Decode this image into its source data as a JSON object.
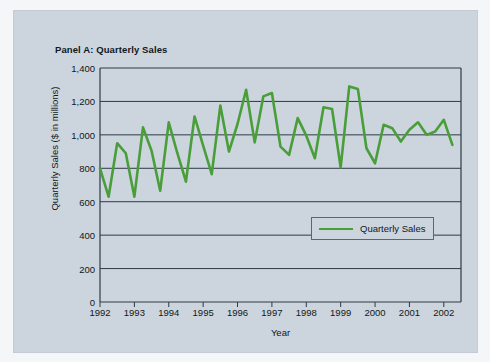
{
  "figure": {
    "panel_title": "Panel A: Quarterly Sales",
    "background_color": "#ccd5dd",
    "axis_color": "#2d3a46",
    "series_color": "#4a9e3a"
  },
  "legend": {
    "position": "inside-lower-right",
    "entries": [
      {
        "label": "Quarterly Sales",
        "color": "#4a9e3a",
        "marker": "line"
      }
    ]
  },
  "chart_data": {
    "type": "line",
    "title": "Panel A: Quarterly Sales",
    "xlabel": "Year",
    "ylabel": "Quarterly Sales ($ in millions)",
    "xlim": [
      1992.0,
      2002.5
    ],
    "ylim": [
      0,
      1400
    ],
    "ytick_labels": [
      "0",
      "200",
      "400",
      "600",
      "800",
      "1,000",
      "1,200",
      "1,400"
    ],
    "ytick_values": [
      0,
      200,
      400,
      600,
      800,
      1000,
      1200,
      1400
    ],
    "xtick_labels": [
      "1992",
      "1993",
      "1994",
      "1995",
      "1996",
      "1997",
      "1998",
      "1999",
      "2000",
      "2001",
      "2002"
    ],
    "xtick_values": [
      1992,
      1993,
      1994,
      1995,
      1996,
      1997,
      1998,
      1999,
      2000,
      2001,
      2002
    ],
    "grid": "horizontal",
    "legend_position": "inside-lower-right",
    "series": [
      {
        "name": "Quarterly Sales",
        "color": "#4a9e3a",
        "x": [
          1992.0,
          1992.25,
          1992.5,
          1992.75,
          1993.0,
          1993.25,
          1993.5,
          1993.75,
          1994.0,
          1994.25,
          1994.5,
          1994.75,
          1995.0,
          1995.25,
          1995.5,
          1995.75,
          1996.0,
          1996.25,
          1996.5,
          1996.75,
          1997.0,
          1997.25,
          1997.5,
          1997.75,
          1998.0,
          1998.25,
          1998.5,
          1998.75,
          1999.0,
          1999.25,
          1999.5,
          1999.75,
          2000.0,
          2000.25,
          2000.5,
          2000.75,
          2001.0,
          2001.25,
          2001.5,
          2001.75,
          2002.0,
          2002.25
        ],
        "values": [
          800,
          630,
          950,
          890,
          630,
          1045,
          905,
          665,
          1075,
          890,
          720,
          1110,
          935,
          765,
          1175,
          900,
          1065,
          1270,
          955,
          1230,
          1250,
          930,
          880,
          1100,
          995,
          860,
          1165,
          1155,
          805,
          1290,
          1275,
          920,
          830,
          1060,
          1040,
          960,
          1030,
          1075,
          1000,
          1020,
          1090,
          940
        ]
      }
    ],
    "data_table": {
      "columns": [
        "Year",
        "Q1",
        "Q2",
        "Q3",
        "Q4"
      ],
      "rows": [
        [
          "1992",
          800,
          630,
          950,
          890
        ],
        [
          "1993",
          630,
          1045,
          905,
          665
        ],
        [
          "1994",
          1075,
          890,
          720,
          1110
        ],
        [
          "1995",
          935,
          765,
          1175,
          900
        ],
        [
          "1996",
          1065,
          1270,
          955,
          1230
        ],
        [
          "1997",
          1250,
          930,
          880,
          1100
        ],
        [
          "1998",
          995,
          860,
          1165,
          1155
        ],
        [
          "1999",
          805,
          1290,
          1275,
          920
        ],
        [
          "2000",
          830,
          null,
          null,
          null
        ]
      ]
    }
  }
}
